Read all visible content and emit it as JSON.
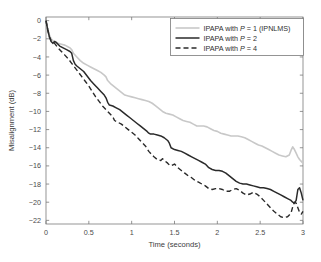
{
  "chart_data": {
    "type": "line",
    "title": "",
    "xlabel": "Time (seconds)",
    "ylabel": "Misalignment (dB)",
    "xlim": [
      0,
      3
    ],
    "ylim": [
      -22.4,
      0.4
    ],
    "xticks": [
      0,
      0.5,
      1,
      1.5,
      2,
      2.5,
      3
    ],
    "xticklabels": [
      "0",
      "0.5",
      "1",
      "1.5",
      "2",
      "2.5",
      "3"
    ],
    "yticks": [
      0,
      -2,
      -4,
      -6,
      -8,
      -10,
      -12,
      -14,
      -16,
      -18,
      -20,
      -22
    ],
    "yticklabels": [
      "0",
      "-2",
      "-4",
      "-6",
      "-8",
      "-10",
      "-12",
      "-14",
      "-16",
      "-18",
      "-20",
      "-22"
    ],
    "grid": false,
    "legend_position": "upper right",
    "series": [
      {
        "name": "IPAPA with P = 1 (IPNLMS)",
        "style": "solid",
        "color": "#c8c8c8",
        "width": 1.6,
        "x": [
          0.0,
          0.02,
          0.04,
          0.06,
          0.08,
          0.1,
          0.14,
          0.18,
          0.22,
          0.26,
          0.28,
          0.3,
          0.32,
          0.36,
          0.4,
          0.44,
          0.48,
          0.52,
          0.56,
          0.6,
          0.64,
          0.68,
          0.7,
          0.72,
          0.76,
          0.8,
          0.84,
          0.88,
          0.92,
          0.96,
          1.0,
          1.04,
          1.08,
          1.12,
          1.16,
          1.2,
          1.24,
          1.28,
          1.32,
          1.36,
          1.4,
          1.44,
          1.48,
          1.52,
          1.56,
          1.6,
          1.64,
          1.68,
          1.72,
          1.76,
          1.8,
          1.84,
          1.88,
          1.92,
          1.96,
          2.0,
          2.04,
          2.08,
          2.12,
          2.16,
          2.2,
          2.24,
          2.28,
          2.32,
          2.36,
          2.4,
          2.44,
          2.48,
          2.52,
          2.56,
          2.6,
          2.64,
          2.68,
          2.72,
          2.76,
          2.8,
          2.84,
          2.86,
          2.88,
          2.9,
          2.92,
          2.94,
          2.96,
          2.98,
          3.0
        ],
        "y": [
          0.0,
          -0.9,
          -1.6,
          -2.0,
          -2.2,
          -2.3,
          -2.5,
          -2.6,
          -2.7,
          -2.9,
          -3.0,
          -3.2,
          -3.6,
          -4.0,
          -4.4,
          -4.7,
          -4.9,
          -5.1,
          -5.3,
          -5.5,
          -5.7,
          -6.0,
          -6.2,
          -6.6,
          -7.0,
          -7.3,
          -7.6,
          -7.9,
          -8.2,
          -8.3,
          -8.4,
          -8.5,
          -8.6,
          -8.7,
          -8.8,
          -8.9,
          -9.1,
          -9.4,
          -9.7,
          -10.0,
          -10.2,
          -10.3,
          -10.4,
          -10.6,
          -10.8,
          -11.0,
          -11.1,
          -11.2,
          -11.4,
          -11.6,
          -11.6,
          -11.6,
          -11.7,
          -11.9,
          -12.1,
          -12.2,
          -12.4,
          -12.5,
          -12.6,
          -12.7,
          -12.7,
          -12.7,
          -12.8,
          -12.9,
          -13.1,
          -13.3,
          -13.5,
          -13.7,
          -13.8,
          -14.0,
          -14.2,
          -14.4,
          -14.6,
          -14.8,
          -14.9,
          -15.0,
          -14.8,
          -14.3,
          -13.9,
          -14.2,
          -14.6,
          -15.0,
          -15.3,
          -15.5,
          -15.7
        ]
      },
      {
        "name": "IPAPA with P = 2",
        "style": "solid",
        "color": "#2a2a2a",
        "width": 1.5,
        "x": [
          0.0,
          0.02,
          0.04,
          0.06,
          0.08,
          0.1,
          0.12,
          0.16,
          0.2,
          0.24,
          0.28,
          0.3,
          0.32,
          0.34,
          0.36,
          0.4,
          0.44,
          0.48,
          0.52,
          0.56,
          0.6,
          0.64,
          0.68,
          0.7,
          0.72,
          0.74,
          0.78,
          0.82,
          0.86,
          0.9,
          0.94,
          0.98,
          1.02,
          1.06,
          1.1,
          1.14,
          1.18,
          1.2,
          1.22,
          1.26,
          1.3,
          1.34,
          1.38,
          1.42,
          1.44,
          1.46,
          1.5,
          1.54,
          1.58,
          1.62,
          1.66,
          1.7,
          1.74,
          1.78,
          1.82,
          1.86,
          1.9,
          1.94,
          1.98,
          2.02,
          2.06,
          2.1,
          2.14,
          2.18,
          2.22,
          2.26,
          2.3,
          2.34,
          2.38,
          2.42,
          2.46,
          2.5,
          2.54,
          2.58,
          2.62,
          2.66,
          2.7,
          2.74,
          2.78,
          2.82,
          2.86,
          2.88,
          2.9,
          2.92,
          2.94,
          2.96,
          2.98,
          3.0
        ],
        "y": [
          0.0,
          -1.0,
          -1.8,
          -2.3,
          -2.5,
          -2.3,
          -2.4,
          -2.8,
          -3.0,
          -3.2,
          -3.4,
          -3.6,
          -4.4,
          -4.8,
          -5.0,
          -5.3,
          -5.6,
          -6.1,
          -6.6,
          -7.0,
          -7.4,
          -7.8,
          -8.2,
          -8.5,
          -9.0,
          -9.3,
          -9.4,
          -9.6,
          -9.8,
          -10.1,
          -10.4,
          -10.7,
          -11.0,
          -11.3,
          -11.6,
          -11.9,
          -12.2,
          -12.4,
          -12.5,
          -12.5,
          -12.6,
          -12.7,
          -12.9,
          -13.2,
          -13.5,
          -14.0,
          -14.2,
          -14.3,
          -14.4,
          -14.6,
          -14.8,
          -15.0,
          -15.2,
          -15.4,
          -15.6,
          -15.8,
          -16.2,
          -16.4,
          -16.5,
          -16.5,
          -16.6,
          -16.8,
          -17.1,
          -17.4,
          -17.7,
          -17.9,
          -18.0,
          -18.0,
          -18.1,
          -18.2,
          -18.3,
          -18.4,
          -18.4,
          -18.5,
          -18.6,
          -18.8,
          -19.0,
          -19.2,
          -19.4,
          -19.6,
          -19.8,
          -20.0,
          -20.1,
          -19.8,
          -18.6,
          -18.4,
          -19.0,
          -19.8
        ]
      },
      {
        "name": "IPAPA with P = 4",
        "style": "dashed",
        "color": "#2a2a2a",
        "width": 1.4,
        "x": [
          0.0,
          0.02,
          0.04,
          0.06,
          0.08,
          0.1,
          0.14,
          0.18,
          0.22,
          0.26,
          0.3,
          0.34,
          0.38,
          0.42,
          0.46,
          0.5,
          0.54,
          0.58,
          0.62,
          0.66,
          0.7,
          0.74,
          0.78,
          0.8,
          0.84,
          0.88,
          0.92,
          0.96,
          1.0,
          1.04,
          1.08,
          1.12,
          1.16,
          1.18,
          1.2,
          1.22,
          1.26,
          1.3,
          1.34,
          1.36,
          1.38,
          1.42,
          1.44,
          1.46,
          1.5,
          1.54,
          1.58,
          1.62,
          1.66,
          1.7,
          1.74,
          1.78,
          1.82,
          1.86,
          1.9,
          1.94,
          1.98,
          2.02,
          2.06,
          2.1,
          2.14,
          2.18,
          2.22,
          2.26,
          2.3,
          2.34,
          2.38,
          2.42,
          2.46,
          2.5,
          2.54,
          2.58,
          2.62,
          2.66,
          2.7,
          2.74,
          2.78,
          2.82,
          2.86,
          2.88,
          2.9,
          2.92,
          2.94,
          2.96,
          2.98,
          3.0
        ],
        "y": [
          0.0,
          -1.0,
          -1.8,
          -2.2,
          -2.3,
          -2.5,
          -3.0,
          -3.4,
          -3.8,
          -4.2,
          -4.7,
          -5.2,
          -5.7,
          -6.2,
          -6.7,
          -7.2,
          -7.8,
          -8.4,
          -8.9,
          -9.4,
          -9.8,
          -10.2,
          -10.6,
          -11.0,
          -11.2,
          -11.4,
          -11.7,
          -12.0,
          -12.3,
          -12.6,
          -13.0,
          -13.4,
          -13.8,
          -14.1,
          -14.4,
          -14.6,
          -15.0,
          -15.3,
          -15.4,
          -15.2,
          -15.4,
          -15.7,
          -15.9,
          -16.0,
          -15.8,
          -16.2,
          -16.5,
          -16.8,
          -17.1,
          -17.3,
          -17.6,
          -17.8,
          -18.0,
          -18.2,
          -18.5,
          -18.6,
          -18.5,
          -18.5,
          -18.6,
          -18.8,
          -18.8,
          -18.6,
          -18.5,
          -18.7,
          -19.0,
          -19.2,
          -19.1,
          -18.9,
          -19.1,
          -19.4,
          -19.8,
          -20.2,
          -20.6,
          -21.0,
          -21.3,
          -21.6,
          -21.7,
          -21.6,
          -21.2,
          -20.5,
          -20.0,
          -20.1,
          -20.6,
          -21.1,
          -21.3,
          -21.0
        ]
      }
    ]
  },
  "legend": {
    "entries": [
      {
        "prefix": "IPAPA with ",
        "italic": "P",
        "suffix": " = 1 (IPNLMS)"
      },
      {
        "prefix": "IPAPA with ",
        "italic": "P",
        "suffix": " = 2"
      },
      {
        "prefix": "IPAPA with ",
        "italic": "P",
        "suffix": " = 4"
      }
    ]
  }
}
